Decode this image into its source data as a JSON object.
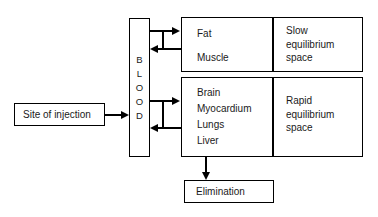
{
  "diagram": {
    "nodes": {
      "injection": {
        "label": "Site of injection"
      },
      "blood": {
        "label": "BLOOD",
        "letters": [
          "B",
          "L",
          "O",
          "O",
          "D"
        ]
      },
      "slow_tissues": {
        "items": [
          "Fat",
          "Muscle"
        ]
      },
      "slow_space": {
        "lines": [
          "Slow",
          "equilibrium",
          "space"
        ]
      },
      "rapid_tissues": {
        "items": [
          "Brain",
          "Myocardium",
          "Lungs",
          "Liver"
        ]
      },
      "rapid_space": {
        "lines": [
          "Rapid",
          "equilibrium",
          "space"
        ]
      },
      "elimination": {
        "label": "Elimination"
      }
    },
    "colors": {
      "stroke": "#000000",
      "text": "#1a1a1a",
      "background": "#ffffff"
    },
    "edges": [
      {
        "name": "injection-to-blood",
        "direction": "right"
      },
      {
        "name": "blood-to-slow",
        "direction": "right"
      },
      {
        "name": "slow-to-blood",
        "direction": "left"
      },
      {
        "name": "blood-to-rapid",
        "direction": "right"
      },
      {
        "name": "rapid-to-blood",
        "direction": "left"
      },
      {
        "name": "rapid-to-elimination",
        "direction": "down"
      }
    ]
  }
}
